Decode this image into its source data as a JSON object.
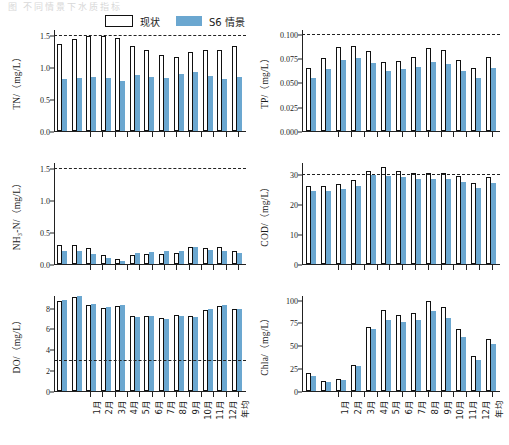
{
  "faint_header": "图  不同情景下水质指标",
  "legend": {
    "current": {
      "label": "现状",
      "swatch": "white-outline",
      "color": "#ffffff"
    },
    "scenario": {
      "label": "S6 情景",
      "swatch": "blue-fill",
      "color": "#6ba7d0"
    }
  },
  "categories": [
    "1月",
    "2月",
    "3月",
    "4月",
    "5月",
    "6月",
    "7月",
    "8月",
    "9月",
    "10月",
    "11月",
    "12月",
    "年均"
  ],
  "chart_data": [
    {
      "type": "bar",
      "id": "tn",
      "title": "",
      "ylabel": "TN/（mg/L）",
      "xlabel": "",
      "ylim": [
        0.0,
        1.6
      ],
      "yticks": [
        0.0,
        0.5,
        1.0,
        1.5
      ],
      "ytick_labels": [
        "0.0",
        "0.5",
        "1.0",
        "1.5"
      ],
      "threshold": 1.5,
      "grid": false,
      "legend_position": "top-center",
      "categories": [
        "1月",
        "2月",
        "3月",
        "4月",
        "5月",
        "6月",
        "7月",
        "8月",
        "9月",
        "10月",
        "11月",
        "12月",
        "年均"
      ],
      "series": [
        {
          "name": "现状",
          "values": [
            1.38,
            1.45,
            1.5,
            1.51,
            1.47,
            1.34,
            1.28,
            1.2,
            1.17,
            1.25,
            1.28,
            1.29,
            1.34
          ]
        },
        {
          "name": "S6 情景",
          "values": [
            0.83,
            0.84,
            0.85,
            0.84,
            0.79,
            0.89,
            0.86,
            0.84,
            0.91,
            0.93,
            0.87,
            0.83,
            0.85
          ]
        }
      ]
    },
    {
      "type": "bar",
      "id": "tp",
      "title": "",
      "ylabel": "TP/（mg/L）",
      "xlabel": "",
      "ylim": [
        0.0,
        0.105
      ],
      "yticks": [
        0.0,
        0.025,
        0.05,
        0.075,
        0.1
      ],
      "ytick_labels": [
        "0.000",
        "0.025",
        "0.050",
        "0.075",
        "0.100"
      ],
      "threshold": 0.1,
      "grid": false,
      "legend_position": "none",
      "categories": [
        "1月",
        "2月",
        "3月",
        "4月",
        "5月",
        "6月",
        "7月",
        "8月",
        "9月",
        "10月",
        "11月",
        "12月",
        "年均"
      ],
      "series": [
        {
          "name": "现状",
          "values": [
            0.066,
            0.076,
            0.087,
            0.088,
            0.083,
            0.072,
            0.073,
            0.077,
            0.086,
            0.084,
            0.074,
            0.066,
            0.077
          ]
        },
        {
          "name": "S6 情景",
          "values": [
            0.055,
            0.064,
            0.074,
            0.076,
            0.071,
            0.062,
            0.064,
            0.067,
            0.072,
            0.07,
            0.062,
            0.055,
            0.065
          ]
        }
      ]
    },
    {
      "type": "bar",
      "id": "nh3n",
      "title": "",
      "ylabel": "NH₃-N/（mg/L）",
      "xlabel": "",
      "ylim": [
        0.0,
        1.6
      ],
      "yticks": [
        0.0,
        0.5,
        1.0,
        1.5
      ],
      "ytick_labels": [
        "0.0",
        "0.5",
        "1.0",
        "1.5"
      ],
      "threshold": 1.5,
      "grid": false,
      "legend_position": "none",
      "categories": [
        "1月",
        "2月",
        "3月",
        "4月",
        "5月",
        "6月",
        "7月",
        "8月",
        "9月",
        "10月",
        "11月",
        "12月",
        "年均"
      ],
      "series": [
        {
          "name": "现状",
          "values": [
            0.3,
            0.3,
            0.26,
            0.15,
            0.08,
            0.15,
            0.16,
            0.16,
            0.17,
            0.27,
            0.25,
            0.27,
            0.21
          ]
        },
        {
          "name": "S6 情景",
          "values": [
            0.21,
            0.2,
            0.16,
            0.1,
            0.05,
            0.18,
            0.19,
            0.2,
            0.21,
            0.27,
            0.22,
            0.2,
            0.18
          ]
        }
      ]
    },
    {
      "type": "bar",
      "id": "cod",
      "title": "",
      "ylabel": "COD/（mg/L）",
      "xlabel": "",
      "ylim": [
        0,
        34
      ],
      "yticks": [
        0,
        10,
        20,
        30
      ],
      "ytick_labels": [
        "0",
        "10",
        "20",
        "30"
      ],
      "threshold": 30,
      "grid": false,
      "legend_position": "none",
      "categories": [
        "1月",
        "2月",
        "3月",
        "4月",
        "5月",
        "6月",
        "7月",
        "8月",
        "9月",
        "10月",
        "11月",
        "12月",
        "年均"
      ],
      "series": [
        {
          "name": "现状",
          "values": [
            26.4,
            26.3,
            26.8,
            28.3,
            31.4,
            32.7,
            31.2,
            30.6,
            30.8,
            30.8,
            29.6,
            27.3,
            29.3
          ]
        },
        {
          "name": "S6 情景",
          "values": [
            24.6,
            24.5,
            25.1,
            26.3,
            29.9,
            29.7,
            29.3,
            28.5,
            28.7,
            28.7,
            27.5,
            25.6,
            27.3
          ]
        }
      ]
    },
    {
      "type": "bar",
      "id": "do",
      "title": "",
      "ylabel": "DO/（mg/L）",
      "xlabel": "",
      "ylim": [
        0,
        9.2
      ],
      "yticks": [
        0,
        2,
        4,
        6,
        8
      ],
      "ytick_labels": [
        "0",
        "2",
        "4",
        "6",
        "8"
      ],
      "threshold": 3,
      "grid": false,
      "legend_position": "none",
      "categories": [
        "1月",
        "2月",
        "3月",
        "4月",
        "5月",
        "6月",
        "7月",
        "8月",
        "9月",
        "10月",
        "11月",
        "12月",
        "年均"
      ],
      "series": [
        {
          "name": "现状",
          "values": [
            8.7,
            9.1,
            8.3,
            8.0,
            8.2,
            7.3,
            7.3,
            7.1,
            7.4,
            7.3,
            7.8,
            8.2,
            7.9
          ]
        },
        {
          "name": "S6 情景",
          "values": [
            8.8,
            9.2,
            8.4,
            8.1,
            8.3,
            7.2,
            7.3,
            7.0,
            7.3,
            7.2,
            7.9,
            8.3,
            7.9
          ]
        }
      ]
    },
    {
      "type": "bar",
      "id": "chla",
      "title": "",
      "ylabel": "Chla/（mg/L）",
      "xlabel": "",
      "ylim": [
        0,
        105
      ],
      "yticks": [
        0,
        25,
        50,
        75,
        100
      ],
      "ytick_labels": [
        "0",
        "25",
        "50",
        "75",
        "100"
      ],
      "threshold": null,
      "grid": false,
      "legend_position": "none",
      "categories": [
        "1月",
        "2月",
        "3月",
        "4月",
        "5月",
        "6月",
        "7月",
        "8月",
        "9月",
        "10月",
        "11月",
        "12月",
        "年均"
      ],
      "series": [
        {
          "name": "现状",
          "values": [
            20,
            11,
            13,
            29,
            71,
            90,
            84,
            86,
            99,
            93,
            68,
            39,
            58
          ]
        },
        {
          "name": "S6 情景",
          "values": [
            17,
            10,
            12,
            28,
            69,
            79,
            76,
            78,
            88,
            81,
            60,
            34,
            52
          ]
        }
      ]
    }
  ]
}
